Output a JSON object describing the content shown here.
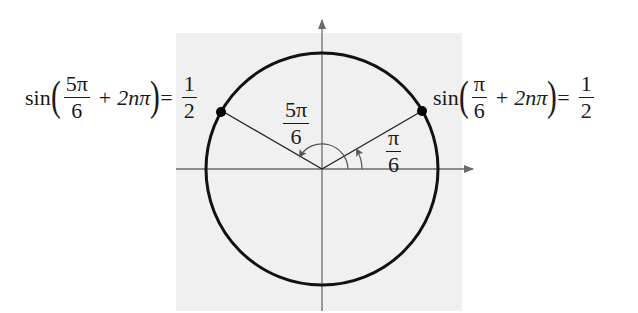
{
  "diagram": {
    "type": "unit-circle",
    "background_color": "#f0f0f0",
    "circle_color": "#111111",
    "axis_color": "#6b6b6b",
    "point_color": "#000000",
    "labels": {
      "angle_right": {
        "numerator": "π",
        "denominator": "6"
      },
      "angle_left": {
        "numerator": "5π",
        "denominator": "6"
      }
    },
    "equations": {
      "left": {
        "func": "sin",
        "arg_numerator": "5π",
        "arg_denominator": "6",
        "plus": "+",
        "period_term": "2nπ",
        "equals": "=",
        "result_numerator": "1",
        "result_denominator": "2"
      },
      "right": {
        "func": "sin",
        "arg_numerator": "π",
        "arg_denominator": "6",
        "plus": "+",
        "period_term": "2nπ",
        "equals": "=",
        "result_numerator": "1",
        "result_denominator": "2"
      }
    },
    "points": [
      {
        "name": "point-pi-over-6",
        "angle": "π/6"
      },
      {
        "name": "point-5pi-over-6",
        "angle": "5π/6"
      }
    ]
  }
}
